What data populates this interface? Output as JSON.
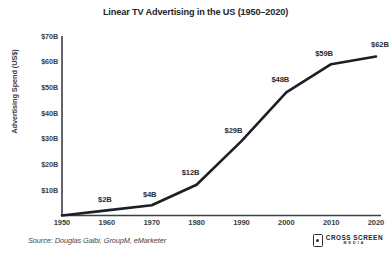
{
  "chart_data": {
    "type": "line",
    "title": "Linear TV Advertising in the US (1950–2020)",
    "xlabel": "",
    "ylabel": "Advertising Spend (US$)",
    "x": [
      1950,
      1960,
      1970,
      1980,
      1990,
      2000,
      2010,
      2020
    ],
    "categories": [
      "1950",
      "1960",
      "1970",
      "1980",
      "1990",
      "2000",
      "2010",
      "2020"
    ],
    "values": [
      0,
      2,
      4,
      12,
      29,
      48,
      59,
      62
    ],
    "point_labels": [
      "",
      "$2B",
      "$4B",
      "$12B",
      "$29B",
      "$48B",
      "$59B",
      "$62B"
    ],
    "xlim": [
      1950,
      2020
    ],
    "ylim": [
      0,
      70
    ],
    "y_ticks": [
      10,
      20,
      30,
      40,
      50,
      60,
      70
    ],
    "y_tick_labels": [
      "$10B",
      "$20B",
      "$30B",
      "$40B",
      "$50B",
      "$60B",
      "$70B"
    ],
    "x_tick_labels": [
      "1950",
      "1960",
      "1970",
      "1980",
      "1990",
      "2000",
      "2010",
      "2020"
    ],
    "grid": false,
    "legend": "none",
    "line_color": "#1c1f24",
    "background_color": "#ffffff",
    "axis_color": "#3b3e44"
  },
  "footer": {
    "source": "Source: Douglas Galbi, GroupM, eMarketer",
    "brand_name": "CROSS SCREEN",
    "brand_sub": "MEDIA"
  }
}
